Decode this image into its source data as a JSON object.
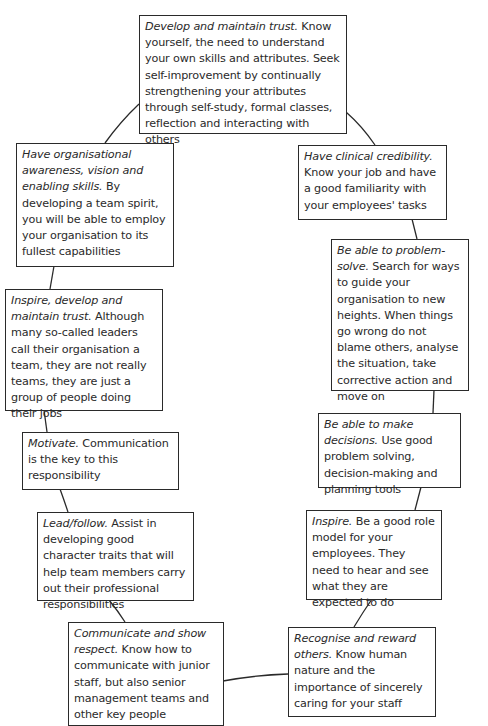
{
  "diagram": {
    "type": "cycle",
    "nodes": [
      {
        "id": "trust",
        "lead": "Develop and maintain trust.",
        "body": " Know yourself, the need to understand your own skills and attributes. Seek self-improvement by continually strengthening your attributes through self-study, formal classes, reflection and interacting with others"
      },
      {
        "id": "clinical",
        "lead": "Have clinical credibility.",
        "body": " Know your job and have a good familiarity with your employees' tasks"
      },
      {
        "id": "problem",
        "lead": "Be able to problem-solve.",
        "body": " Search for ways to guide your organisation to new heights. When things go wrong do not blame others, analyse the situation, take corrective action and move on"
      },
      {
        "id": "decisions",
        "lead": "Be able to make decisions.",
        "body": " Use good problem solving, decision-making and planning tools"
      },
      {
        "id": "inspire",
        "lead": "Inspire.",
        "body": " Be a good role model for your employees. They need to hear and see what they are expected to do"
      },
      {
        "id": "recognise",
        "lead": "Recognise and reward others.",
        "body": " Know human nature and the importance of sincerely caring for your staff"
      },
      {
        "id": "communicate",
        "lead": "Communicate and show respect.",
        "body": " Know how to communicate with junior staff, but also senior management teams and other key people"
      },
      {
        "id": "lead",
        "lead": "Lead/follow.",
        "body": " Assist in developing good character traits that will help team members carry out their professional responsibilities"
      },
      {
        "id": "motivate",
        "lead": "Motivate.",
        "body": " Communication is the key to this responsibility"
      },
      {
        "id": "inspire_trust",
        "lead": "Inspire, develop and maintain trust.",
        "body": " Although many so-called leaders call their organisation a team, they are not really teams, they are just a group of people doing their jobs"
      },
      {
        "id": "awareness",
        "lead": "Have organisational awareness, vision and enabling skills.",
        "body": " By developing a team spirit, you will be able to employ your organisation to its fullest capabilities"
      }
    ]
  }
}
